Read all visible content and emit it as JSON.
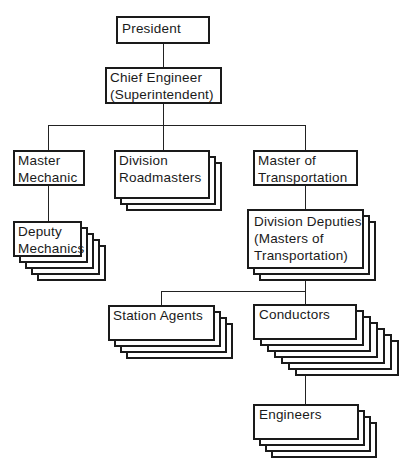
{
  "diagram": {
    "type": "organization-chart",
    "nodes": {
      "president": {
        "lines": [
          "President"
        ],
        "stack_count": 1
      },
      "chief_engineer": {
        "lines": [
          "Chief Engineer",
          "(Superintendent)"
        ],
        "stack_count": 1
      },
      "master_mechanic": {
        "lines": [
          "Master",
          "Mechanic"
        ],
        "stack_count": 1
      },
      "division_roadmasters": {
        "lines": [
          "Division",
          "Roadmasters"
        ],
        "stack_count": 3
      },
      "master_of_transportation": {
        "lines": [
          "Master of",
          "Transportation"
        ],
        "stack_count": 1
      },
      "deputy_mechanics": {
        "lines": [
          "Deputy",
          "Mechanics"
        ],
        "stack_count": 5
      },
      "division_deputies": {
        "lines": [
          "Division Deputies",
          "(Masters of",
          "Transportation)"
        ],
        "stack_count": 3
      },
      "station_agents": {
        "lines": [
          "Station Agents"
        ],
        "stack_count": 4
      },
      "conductors": {
        "lines": [
          "Conductors"
        ],
        "stack_count": 7
      },
      "engineers": {
        "lines": [
          "Engineers"
        ],
        "stack_count": 4
      }
    },
    "edges": [
      [
        "president",
        "chief_engineer"
      ],
      [
        "chief_engineer",
        "master_mechanic"
      ],
      [
        "chief_engineer",
        "division_roadmasters"
      ],
      [
        "chief_engineer",
        "master_of_transportation"
      ],
      [
        "master_mechanic",
        "deputy_mechanics"
      ],
      [
        "master_of_transportation",
        "division_deputies"
      ],
      [
        "division_deputies",
        "station_agents"
      ],
      [
        "division_deputies",
        "conductors"
      ],
      [
        "conductors",
        "engineers"
      ]
    ]
  }
}
